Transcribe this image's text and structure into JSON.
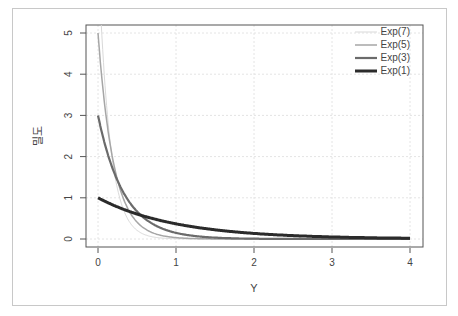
{
  "chart_data": {
    "type": "line",
    "title": "",
    "xlabel": "Y",
    "ylabel": "밀도",
    "xlim": [
      0,
      4
    ],
    "ylim": [
      0,
      5
    ],
    "grid": true,
    "legend_position": "top-right",
    "x_ticks": [
      "0",
      "1",
      "2",
      "3",
      "4"
    ],
    "y_ticks": [
      "0",
      "1",
      "2",
      "3",
      "4",
      "5"
    ],
    "series": [
      {
        "name": "Exp(7)",
        "rate": 7,
        "color": "#d9d9d9",
        "width": 1,
        "x": [
          0,
          0.1,
          0.2,
          0.3,
          0.5,
          1,
          2,
          3,
          4
        ],
        "values": [
          7,
          3.48,
          1.73,
          0.86,
          0.21,
          0.006,
          0,
          0,
          0
        ]
      },
      {
        "name": "Exp(5)",
        "rate": 5,
        "color": "#a6a6a6",
        "width": 1.5,
        "x": [
          0,
          0.1,
          0.2,
          0.3,
          0.5,
          1,
          2,
          3,
          4
        ],
        "values": [
          5,
          3.03,
          1.84,
          1.12,
          0.41,
          0.034,
          0,
          0,
          0
        ]
      },
      {
        "name": "Exp(3)",
        "rate": 3,
        "color": "#6b6b6b",
        "width": 2.2,
        "x": [
          0,
          0.1,
          0.2,
          0.3,
          0.5,
          1,
          2,
          3,
          4
        ],
        "values": [
          3,
          2.22,
          1.65,
          1.22,
          0.67,
          0.15,
          0.007,
          0,
          0
        ]
      },
      {
        "name": "Exp(1)",
        "rate": 1,
        "color": "#2b2b2b",
        "width": 3,
        "x": [
          0,
          0.5,
          1,
          2,
          3,
          4
        ],
        "values": [
          1,
          0.61,
          0.37,
          0.14,
          0.05,
          0.018
        ]
      }
    ]
  },
  "axes": {
    "xlabel": "Y",
    "ylabel": "밀도"
  },
  "legend": [
    "Exp(7)",
    "Exp(5)",
    "Exp(3)",
    "Exp(1)"
  ]
}
